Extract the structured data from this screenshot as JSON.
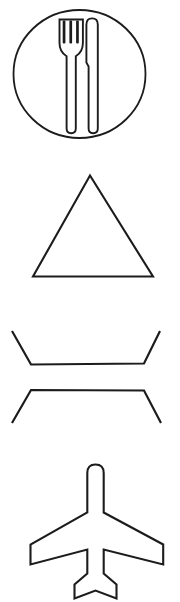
{
  "page": {
    "background_color": "#ffffff",
    "stroke_color": "#1c1c1c",
    "width": 180,
    "height": 602,
    "orientation": "vertical-stack",
    "item_count": 4
  },
  "icons": [
    {
      "id": "restaurant",
      "name": "restaurant-icon",
      "label": "Restaurant",
      "description": "Fork and knife inside a circle",
      "glyph": "fork-and-knife-in-circle",
      "stroke_color": "#1c1c1c",
      "fill_color": "none",
      "stroke_width": 2,
      "bounds": {
        "x": 13,
        "y": 10,
        "width": 133,
        "height": 128
      }
    },
    {
      "id": "mountain",
      "name": "mountain-icon",
      "label": "Mountain",
      "description": "Equilateral triangle outline",
      "glyph": "triangle",
      "stroke_color": "#1c1c1c",
      "fill_color": "none",
      "stroke_width": 2,
      "bounds": {
        "x": 32,
        "y": 175,
        "width": 122,
        "height": 102
      }
    },
    {
      "id": "bowtie",
      "name": "bowtie-icon",
      "label": "Bow Tie",
      "description": "Two opposing open trapezoid brackets forming an hourglass",
      "glyph": "hourglass-brackets",
      "stroke_color": "#1c1c1c",
      "fill_color": "none",
      "stroke_width": 2,
      "bounds": {
        "x": 12,
        "y": 331,
        "width": 148,
        "height": 92
      }
    },
    {
      "id": "airplane",
      "name": "airplane-icon",
      "label": "Airplane",
      "description": "Top-view airplane silhouette outline",
      "glyph": "airplane-top-view",
      "stroke_color": "#1c1c1c",
      "fill_color": "none",
      "stroke_width": 2,
      "bounds": {
        "x": 30,
        "y": 465,
        "width": 133,
        "height": 127
      }
    }
  ]
}
